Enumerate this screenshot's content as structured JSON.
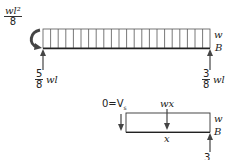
{
  "diagram": {
    "top_beam": {
      "moment_label": {
        "numerator": "wl²",
        "denominator": "8"
      },
      "load_label": "w",
      "support_B_label": "B",
      "left_reaction": {
        "numerator": "5",
        "denominator": "8",
        "suffix": "wl"
      },
      "right_reaction": {
        "numerator": "3",
        "denominator": "8",
        "suffix": "wl"
      },
      "load_cells": 22
    },
    "free_body": {
      "shear_label": "0=V",
      "shear_subscript": "s",
      "resultant_label": "wx",
      "length_label": "x",
      "load_label": "w",
      "support_B_label": "B",
      "reaction_partial": "3"
    },
    "colors": {
      "line": "#333333",
      "load_line": "#555555"
    }
  }
}
